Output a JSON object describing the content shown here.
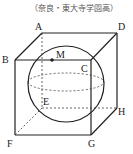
{
  "source": "（奈良・東大寺学園高）",
  "labels": {
    "A": "A",
    "B": "B",
    "C": "C",
    "D": "D",
    "E": "E",
    "F": "F",
    "G": "G",
    "H": "H",
    "M": "M"
  },
  "colors": {
    "line": "#222222",
    "dashed": "#555555",
    "text": "#222222"
  }
}
